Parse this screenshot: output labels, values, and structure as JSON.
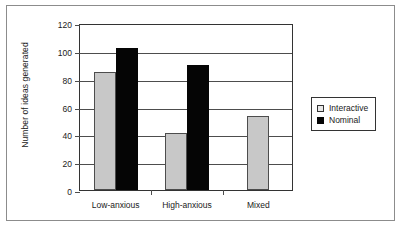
{
  "chart_data": {
    "type": "bar",
    "title": "",
    "xlabel": "",
    "ylabel": "Number of ideas generated",
    "categories": [
      "Low-anxious",
      "High-anxious",
      "Mixed"
    ],
    "series": [
      {
        "name": "Interactive",
        "color": "#c8c8c8",
        "values": [
          85,
          41,
          53
        ]
      },
      {
        "name": "Nominal",
        "color": "#050505",
        "values": [
          102,
          90,
          null
        ]
      }
    ],
    "ylim": [
      0,
      120
    ],
    "yticks": [
      0,
      20,
      40,
      60,
      80,
      100,
      120
    ],
    "ytick_labels": [
      "0",
      "20",
      "40",
      "60",
      "80",
      "100",
      "120"
    ],
    "grid": true,
    "legend_position": "right",
    "legend_entries": [
      "Interactive",
      "Nominal"
    ]
  },
  "figure": {
    "border_color": "#8c8c8c",
    "axis_color": "#333333",
    "grid_color": "#4d4d4d"
  }
}
